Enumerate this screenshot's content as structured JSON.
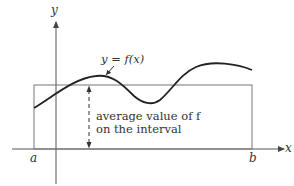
{
  "diagram": {
    "axes": {
      "x_label": "x",
      "y_label": "y"
    },
    "interval": {
      "left_label": "a",
      "right_label": "b"
    },
    "curve_label": "y = f(x)",
    "annotation": {
      "line1": "average value of f",
      "line2": "on the interval"
    },
    "colors": {
      "curve": "#222222",
      "axes": "#555555",
      "rectangle": "#777777",
      "text": "#333333"
    }
  }
}
